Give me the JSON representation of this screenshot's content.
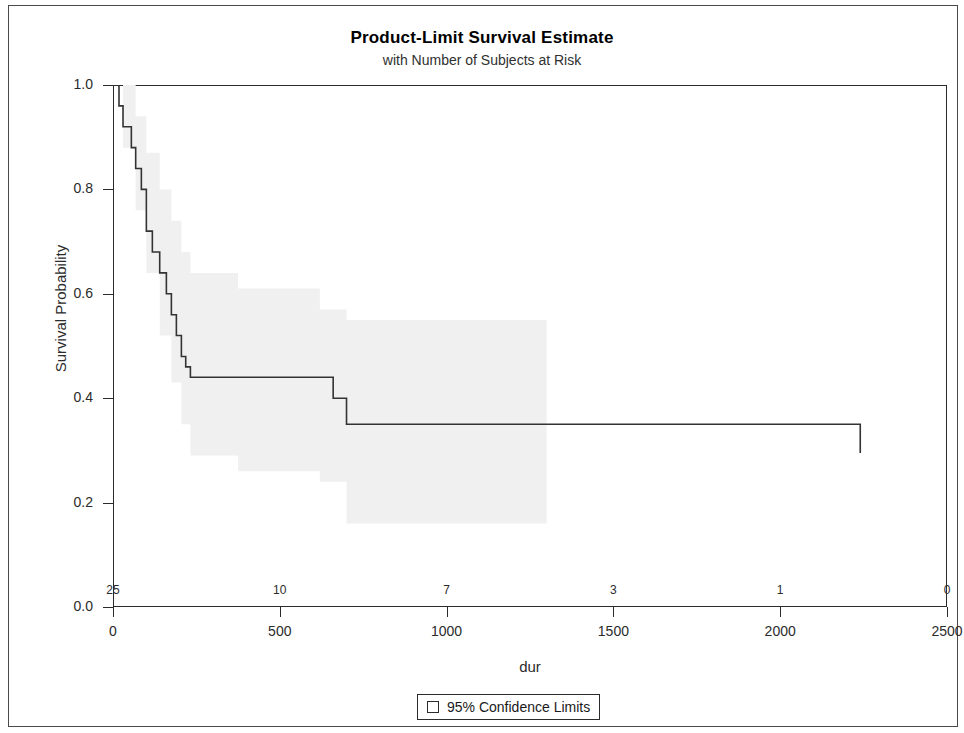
{
  "chart_data": {
    "type": "line",
    "title": "Product-Limit Survival Estimate",
    "subtitle": "with Number of Subjects at Risk",
    "xlabel": "dur",
    "ylabel": "Survival Probability",
    "xlim": [
      0,
      2500
    ],
    "ylim": [
      0.0,
      1.0
    ],
    "xticks": [
      0,
      500,
      1000,
      1500,
      2000,
      2500
    ],
    "xtick_labels": [
      "0",
      "500",
      "1000",
      "1500",
      "2000",
      "2500"
    ],
    "yticks": [
      0.0,
      0.2,
      0.4,
      0.6,
      0.8,
      1.0
    ],
    "ytick_labels": [
      "0.0",
      "0.2",
      "0.4",
      "0.6",
      "0.8",
      "1.0"
    ],
    "grid": false,
    "legend_position": "bottom-center",
    "legend": [
      {
        "label": "95% Confidence Limits",
        "swatch": "open-square",
        "color": "#f0f0f0"
      }
    ],
    "curve_color": "#333333",
    "band_color": "#f0f0f0",
    "n_at_risk_label": "with Number of Subjects at Risk",
    "at_risk": {
      "times": [
        0,
        500,
        1000,
        1500,
        2000,
        2500
      ],
      "counts": [
        25,
        10,
        7,
        3,
        1,
        0
      ],
      "labels": [
        "25",
        "10",
        "7",
        "3",
        "1",
        "0"
      ]
    },
    "series": [
      {
        "name": "Survival Probability",
        "step": "post",
        "x": [
          0,
          18,
          30,
          55,
          68,
          85,
          100,
          118,
          140,
          160,
          175,
          190,
          205,
          218,
          232,
          246,
          620,
          660,
          700,
          1300,
          2240
        ],
        "y": [
          1.0,
          0.96,
          0.92,
          0.88,
          0.84,
          0.8,
          0.72,
          0.68,
          0.64,
          0.6,
          0.56,
          0.52,
          0.48,
          0.46,
          0.44,
          0.44,
          0.44,
          0.4,
          0.35,
          0.35,
          0.295
        ]
      },
      {
        "name": "Upper 95% Confidence Limit",
        "step": "post",
        "x": [
          0,
          30,
          68,
          100,
          140,
          175,
          205,
          232,
          375,
          620,
          700,
          1300
        ],
        "y": [
          1.0,
          1.0,
          0.94,
          0.87,
          0.8,
          0.74,
          0.68,
          0.64,
          0.61,
          0.57,
          0.55,
          0.55
        ]
      },
      {
        "name": "Lower 95% Confidence Limit",
        "step": "post",
        "x": [
          0,
          30,
          68,
          100,
          140,
          175,
          205,
          232,
          375,
          620,
          700,
          1300
        ],
        "y": [
          1.0,
          0.88,
          0.76,
          0.64,
          0.52,
          0.43,
          0.35,
          0.29,
          0.26,
          0.24,
          0.16,
          0.16
        ]
      }
    ],
    "annotations": []
  }
}
